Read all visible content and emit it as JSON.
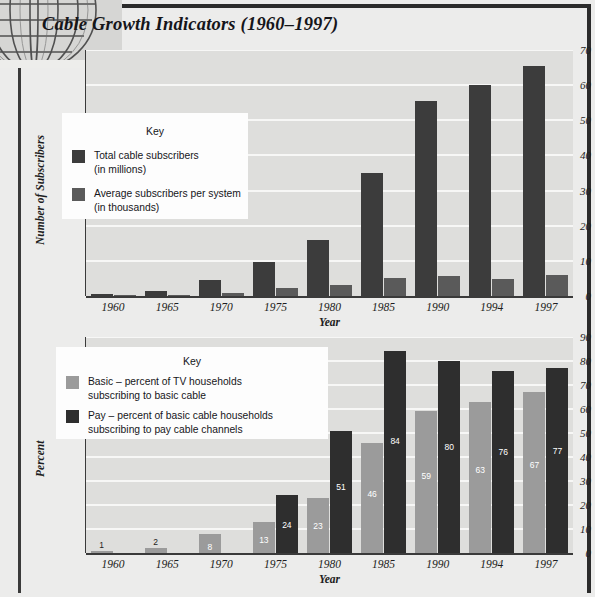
{
  "page": {
    "title": "Cable Growth Indicators (1960–1997)",
    "frame_color": "#2b2b2b",
    "background_color": "#ececeb",
    "plot_background_color": "#dededc",
    "gridline_color": "#f7f7f6"
  },
  "decoration": {
    "globe_icon": "globe-wireframe-icon"
  },
  "chart_data": [
    {
      "id": "cable-subscribers-chart",
      "type": "bar",
      "title": "",
      "xlabel": "Year",
      "ylabel": "Number of Subscribers",
      "ylim": [
        0,
        70
      ],
      "yticks": [
        0,
        10,
        20,
        30,
        40,
        50,
        60,
        70
      ],
      "grid": true,
      "legend_position": "inside-upper-left",
      "legend_title": "Key",
      "categories": [
        "1960",
        "1965",
        "1970",
        "1975",
        "1980",
        "1985",
        "1990",
        "1994",
        "1997"
      ],
      "series": [
        {
          "name": "Total cable subscribers\n(in millions)",
          "short_name": "Total cable subscribers",
          "color": "#3c3c3c",
          "values": [
            0.65,
            1.3,
            4.5,
            9.8,
            16,
            35,
            55.5,
            60,
            65.5
          ],
          "labels": [
            "",
            "",
            "",
            "",
            "",
            "",
            "",
            "",
            ""
          ]
        },
        {
          "name": "Average subscribers per system\n(in thousands)",
          "short_name": "Average subscribers per system",
          "color": "#5a5a5a",
          "values": [
            0.2,
            0.35,
            1.0,
            2.2,
            3.0,
            5.0,
            5.6,
            4.8,
            5.9
          ],
          "labels": [
            "",
            "",
            "",
            "",
            "",
            "",
            "",
            "",
            ""
          ]
        }
      ]
    },
    {
      "id": "basic-pay-percent-chart",
      "type": "bar",
      "title": "",
      "xlabel": "Year",
      "ylabel": "Percent",
      "ylim": [
        0,
        90
      ],
      "yticks": [
        0,
        10,
        20,
        30,
        40,
        50,
        60,
        70,
        80,
        90
      ],
      "grid": true,
      "legend_position": "inside-upper-left",
      "legend_title": "Key",
      "categories": [
        "1960",
        "1965",
        "1970",
        "1975",
        "1980",
        "1985",
        "1990",
        "1994",
        "1997"
      ],
      "series": [
        {
          "name": "Basic – percent of TV households\nsubscribing to basic cable",
          "short_name": "Basic",
          "color": "#9b9b9b",
          "values": [
            1,
            2,
            8,
            13,
            23,
            46,
            59,
            63,
            67
          ],
          "labels": [
            "1",
            "2",
            "8",
            "13",
            "23",
            "46",
            "59",
            "63",
            "67"
          ],
          "label_colors": [
            "#1d1d21",
            "#1d1d21",
            "#ffffff",
            "#ffffff",
            "#ffffff",
            "#ffffff",
            "#ffffff",
            "#ffffff",
            "#ffffff"
          ]
        },
        {
          "name": "Pay – percent of basic cable households\nsubscribing to pay cable channels",
          "short_name": "Pay",
          "color": "#2e2e2e",
          "values": [
            null,
            null,
            null,
            24,
            51,
            84,
            80,
            76,
            77
          ],
          "labels": [
            "",
            "",
            "",
            "24",
            "51",
            "84",
            "80",
            "76",
            "77"
          ],
          "label_colors": [
            "#ffffff",
            "#ffffff",
            "#ffffff",
            "#ffffff",
            "#ffffff",
            "#ffffff",
            "#ffffff",
            "#ffffff",
            "#ffffff"
          ]
        }
      ]
    }
  ]
}
